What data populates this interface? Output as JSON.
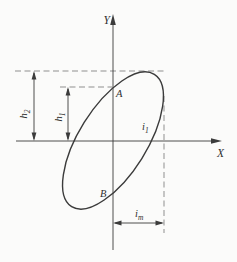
{
  "figure": {
    "name": "tilted-ellipse-axes-diagram",
    "background": "#fbfbfa",
    "stroke_color": "#3b3b3b",
    "dashed_color": "#8f8f8f",
    "label_color": "#2f2f2f",
    "axes": {
      "x_label": "X",
      "y_label": "Y"
    },
    "points": {
      "a": "A",
      "b": "B"
    },
    "measures": {
      "h2": {
        "base": "h",
        "sub": "2"
      },
      "h1": {
        "base": "h",
        "sub": "1"
      },
      "i1": {
        "base": "i",
        "sub": "1"
      },
      "im": {
        "base": "i",
        "sub": "m"
      }
    }
  }
}
